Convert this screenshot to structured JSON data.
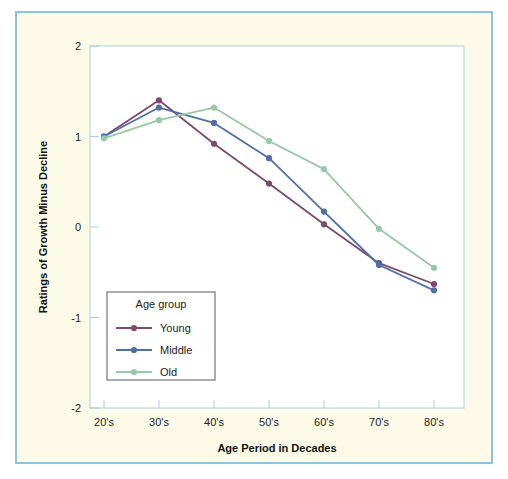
{
  "figure": {
    "background_color": "#fbfbe8",
    "border_color": "#8cc3dd",
    "plot_background_color": "#ffffff",
    "plot_border_color": "#a9cfe4"
  },
  "chart_data": {
    "type": "line",
    "title": "",
    "xlabel": "Age Period in Decades",
    "ylabel": "Ratings of Growth Minus Decline",
    "categories": [
      "20's",
      "30's",
      "40's",
      "50's",
      "60's",
      "70's",
      "80's"
    ],
    "ylim": [
      -2,
      2
    ],
    "yticks": [
      "2",
      "1",
      "0",
      "-1",
      "-2"
    ],
    "ytick_values": [
      2,
      1,
      0,
      -1,
      -2
    ],
    "grid": false,
    "legend_position": "inside-lower-left",
    "legend_title": "Age group",
    "series": [
      {
        "name": "Young",
        "color": "#7d4a6e",
        "marker": "circle",
        "values": [
          1.0,
          1.4,
          0.92,
          0.48,
          0.03,
          -0.4,
          -0.63
        ]
      },
      {
        "name": "Middle",
        "color": "#4f6fa8",
        "marker": "circle",
        "values": [
          1.0,
          1.32,
          1.15,
          0.76,
          0.17,
          -0.42,
          -0.7
        ]
      },
      {
        "name": "Old",
        "color": "#96c9a6",
        "marker": "circle",
        "values": [
          0.98,
          1.18,
          1.32,
          0.95,
          0.64,
          -0.02,
          -0.45
        ]
      }
    ]
  },
  "legend": {
    "title": "Age group",
    "items": [
      {
        "label": "Young",
        "color": "#7d4a6e"
      },
      {
        "label": "Middle",
        "color": "#4f6fa8"
      },
      {
        "label": "Old",
        "color": "#96c9a6"
      }
    ]
  }
}
